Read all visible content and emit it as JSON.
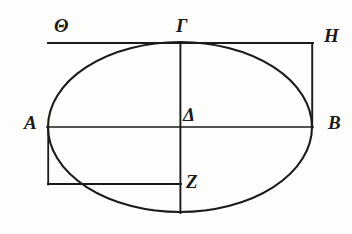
{
  "figure": {
    "background_color": "#fdfdfc",
    "ink_color": "#1a1a1a",
    "width": 352,
    "height": 234
  },
  "labels": {
    "theta": "Θ",
    "gamma": "Γ",
    "eta": "Η",
    "alpha": "A",
    "delta": "Δ",
    "beta": "B",
    "zeta": "Z"
  },
  "geometry": {
    "ellipse": {
      "center_x": 180,
      "center_y": 127,
      "radius_x": 132,
      "radius_y": 85
    },
    "points": {
      "theta": {
        "x": 60,
        "y": 43
      },
      "gamma": {
        "x": 180,
        "y": 43
      },
      "eta": {
        "x": 313,
        "y": 43
      },
      "alpha": {
        "x": 48,
        "y": 127
      },
      "delta": {
        "x": 180,
        "y": 127
      },
      "beta": {
        "x": 312,
        "y": 127
      },
      "zeta": {
        "x": 180,
        "y": 184
      }
    },
    "segments": [
      {
        "name": "tangent-line-theta-gamma-eta",
        "x1": 48,
        "y1": 43,
        "x2": 313,
        "y2": 43
      },
      {
        "name": "vertical-line-eta-beta",
        "x1": 313,
        "y1": 43,
        "x2": 313,
        "y2": 127
      },
      {
        "name": "major-axis-alpha-beta",
        "x1": 48,
        "y1": 127,
        "x2": 313,
        "y2": 127
      },
      {
        "name": "minor-axis-gamma-bottom",
        "x1": 180,
        "y1": 43,
        "x2": 180,
        "y2": 213
      },
      {
        "name": "vertical-line-alpha-down",
        "x1": 48,
        "y1": 127,
        "x2": 48,
        "y2": 184
      },
      {
        "name": "horizontal-line-to-zeta",
        "x1": 48,
        "y1": 184,
        "x2": 180,
        "y2": 184
      }
    ]
  }
}
